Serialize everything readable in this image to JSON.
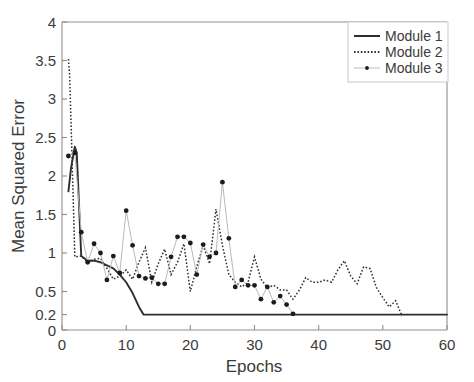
{
  "chart_data": {
    "type": "line",
    "title": "",
    "xlabel": "Epochs",
    "ylabel": "Mean Squared Error",
    "xlim": [
      0,
      60
    ],
    "ylim": [
      0,
      4
    ],
    "xticks": [
      0,
      10,
      20,
      30,
      40,
      50,
      60
    ],
    "xticklabels": [
      "0",
      "10",
      "20",
      "30",
      "40",
      "50",
      "60"
    ],
    "yticks": [
      0,
      0.2,
      0.5,
      1,
      1.5,
      2,
      2.5,
      3,
      3.5,
      4
    ],
    "yticklabels": [
      "0",
      "0.2",
      "0.5",
      "1",
      "1.5",
      "2",
      "2.5",
      "3",
      "3.5",
      "4"
    ],
    "grid": false,
    "legend_position": "top-right",
    "legend": [
      {
        "name": "Module 1",
        "style": "solid",
        "color": "#2e2e2e",
        "marker": "none"
      },
      {
        "name": "Module 2",
        "style": "dotted",
        "color": "#303030",
        "marker": "none"
      },
      {
        "name": "Module 3",
        "style": "thin-line",
        "color": "#bdbdbd",
        "marker": "dot",
        "marker_color": "#1c1c1c"
      }
    ],
    "series": [
      {
        "name": "Module 1",
        "style": "solid",
        "color": "#2e2e2e",
        "x": [
          1,
          1.4,
          2,
          2.3,
          3,
          4,
          5,
          6,
          7,
          8,
          9,
          10,
          11,
          12,
          12.7,
          14,
          20,
          30,
          40,
          50,
          60
        ],
        "values": [
          1.8,
          2.1,
          2.38,
          2.3,
          0.96,
          0.9,
          0.9,
          0.88,
          0.84,
          0.8,
          0.72,
          0.62,
          0.48,
          0.3,
          0.2,
          0.2,
          0.2,
          0.2,
          0.2,
          0.2,
          0.2
        ]
      },
      {
        "name": "Module 2",
        "style": "dotted",
        "color": "#303030",
        "x": [
          1,
          1.2,
          2,
          3,
          4,
          5,
          6,
          7,
          8,
          9,
          10,
          11,
          12,
          13,
          14,
          15,
          16,
          17,
          18,
          19,
          20,
          21,
          22,
          23,
          24,
          25,
          26,
          27,
          28,
          29,
          30,
          31,
          32,
          33,
          34,
          35,
          36,
          37,
          38,
          39,
          40,
          41,
          42,
          43,
          44,
          45,
          46,
          47,
          48,
          49,
          50,
          51,
          52,
          53
        ],
        "values": [
          3.52,
          3.3,
          0.95,
          0.96,
          0.88,
          0.92,
          0.93,
          0.8,
          0.66,
          0.7,
          0.78,
          0.66,
          0.88,
          1.07,
          0.62,
          0.86,
          1.05,
          0.72,
          0.88,
          1.12,
          0.5,
          0.82,
          1.1,
          0.86,
          1.57,
          1.1,
          0.72,
          0.62,
          0.56,
          0.62,
          0.95,
          0.66,
          0.55,
          0.58,
          0.52,
          0.52,
          0.4,
          0.52,
          0.68,
          0.62,
          0.62,
          0.65,
          0.62,
          0.78,
          0.9,
          0.7,
          0.6,
          0.82,
          0.8,
          0.55,
          0.42,
          0.3,
          0.38,
          0.18
        ]
      },
      {
        "name": "Module 3",
        "style": "markers",
        "color": "#bdbdbd",
        "marker_color": "#1c1c1c",
        "x": [
          1,
          2,
          3,
          4,
          5,
          6,
          7,
          8,
          9,
          10,
          11,
          12,
          13,
          14,
          15,
          16,
          17,
          18,
          19,
          20,
          21,
          22,
          23,
          24,
          25,
          26,
          27,
          28,
          29,
          30,
          31,
          32,
          33,
          34,
          35,
          36
        ],
        "values": [
          2.26,
          2.3,
          1.27,
          0.88,
          1.12,
          1.0,
          0.65,
          0.96,
          0.74,
          1.55,
          1.1,
          0.7,
          0.67,
          0.68,
          0.6,
          0.6,
          0.95,
          1.21,
          1.21,
          1.13,
          0.72,
          1.11,
          0.95,
          1.0,
          1.92,
          1.19,
          0.56,
          0.65,
          0.58,
          0.58,
          0.4,
          0.56,
          0.36,
          0.44,
          0.33,
          0.21
        ]
      }
    ]
  },
  "axes": {
    "xlabel": "Epochs",
    "ylabel": "Mean Squared Error"
  }
}
